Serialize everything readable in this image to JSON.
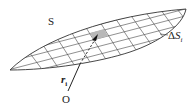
{
  "diagram": {
    "surface_label": "S",
    "patch_label_delta": "Δ",
    "patch_label_var": "S",
    "patch_label_sub": "i",
    "vector_label_var": "r",
    "vector_label_sub": "i",
    "origin_label": "O",
    "colors": {
      "line": "#333333",
      "patch": "#b8b8b8",
      "background": "#ffffff"
    }
  }
}
